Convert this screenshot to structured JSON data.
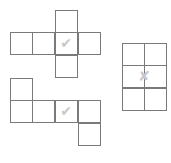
{
  "diagram": {
    "type": "cube nets",
    "cell_size": 23,
    "line_color": "#7a7a7a",
    "mark_color": "#c8c8c8",
    "nets": [
      {
        "name": "net-cross",
        "mark": "✔",
        "mark_label": "correct",
        "cells": [
          [
            55,
            10
          ],
          [
            10,
            32
          ],
          [
            32,
            32
          ],
          [
            55,
            32
          ],
          [
            78,
            32
          ],
          [
            55,
            55
          ]
        ],
        "mark_at": [
          55,
          32
        ]
      },
      {
        "name": "net-step",
        "mark": "✔",
        "mark_label": "correct",
        "cells": [
          [
            10,
            78
          ],
          [
            10,
            100
          ],
          [
            32,
            100
          ],
          [
            55,
            100
          ],
          [
            78,
            100
          ],
          [
            78,
            123
          ]
        ],
        "mark_at": [
          55,
          100
        ]
      },
      {
        "name": "grid-2x3",
        "mark": "✘",
        "mark_label": "incorrect",
        "cells": [
          [
            122,
            43
          ],
          [
            144,
            43
          ],
          [
            122,
            65
          ],
          [
            144,
            65
          ],
          [
            122,
            88
          ],
          [
            144,
            88
          ]
        ],
        "mark_at": [
          133,
          65
        ]
      }
    ]
  }
}
